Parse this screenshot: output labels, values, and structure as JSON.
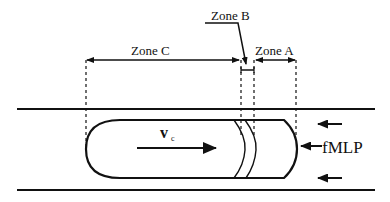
{
  "diagram": {
    "title": "",
    "zones": {
      "zone_c": {
        "label": "Zone C"
      },
      "zone_b": {
        "label": "Zone B"
      },
      "zone_a": {
        "label": "Zone A"
      }
    },
    "cell": {
      "velocity_symbol": "v",
      "velocity_subscript": "c"
    },
    "chemoattractant": {
      "label": "fMLP"
    },
    "colors": {
      "stroke": "#111111",
      "background": "#ffffff"
    }
  }
}
